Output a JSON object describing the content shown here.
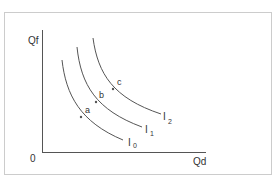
{
  "diagram": {
    "type": "indifference-curve-map",
    "axes": {
      "y_label": "Qf",
      "x_label": "Qd",
      "origin_label": "0"
    },
    "curves": [
      {
        "id": "I0",
        "label_main": "I",
        "label_sub": "0"
      },
      {
        "id": "I1",
        "label_main": "I",
        "label_sub": "1"
      },
      {
        "id": "I2",
        "label_main": "I",
        "label_sub": "2"
      }
    ],
    "points": [
      {
        "label": "a",
        "curve": "I0"
      },
      {
        "label": "b",
        "curve": "I1"
      },
      {
        "label": "c",
        "curve": "I2"
      }
    ],
    "colors": {
      "line": "#555555",
      "text": "#333333",
      "frame": "#cccccc",
      "background": "#ffffff"
    }
  }
}
